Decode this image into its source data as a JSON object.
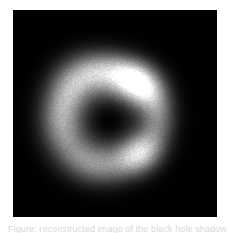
{
  "figure": {
    "panel_background": "#000000",
    "page_background": "#ffffff",
    "colormap": "grayscale",
    "caption_cutoff_text": "Figure: reconstructed image of the black hole shadow"
  },
  "chart_data": {
    "type": "heatmap",
    "title": "",
    "subtitle": "",
    "xlabel": "",
    "ylabel": "",
    "colormap": "grayscale",
    "grid": false,
    "legend": "none",
    "axis_ticks_visible": false,
    "background_color": "#000000",
    "xlim": [
      0,
      204
    ],
    "ylim": [
      0,
      207
    ],
    "value_range": [
      0.0,
      1.0
    ],
    "features": [
      {
        "name": "central-shadow",
        "kind": "dark-depression",
        "cx": 95,
        "cy": 110,
        "rx": 30,
        "ry": 28,
        "intensity": 0.02
      },
      {
        "name": "bright-knot-upper-right",
        "kind": "emission-peak",
        "cx": 120,
        "cy": 75,
        "rx": 26,
        "ry": 22,
        "intensity": 1.0
      },
      {
        "name": "bright-knot-lower-right",
        "kind": "emission-peak",
        "cx": 124,
        "cy": 142,
        "rx": 22,
        "ry": 20,
        "intensity": 0.86
      },
      {
        "name": "left-arc",
        "kind": "emission-arc",
        "cx": 52,
        "cy": 105,
        "rx": 30,
        "ry": 44,
        "intensity": 0.52
      },
      {
        "name": "upper-left-arc",
        "kind": "emission-arc",
        "cx": 72,
        "cy": 62,
        "rx": 34,
        "ry": 26,
        "intensity": 0.45
      },
      {
        "name": "lower-arc",
        "kind": "emission-arc",
        "cx": 84,
        "cy": 152,
        "rx": 32,
        "ry": 24,
        "intensity": 0.4
      },
      {
        "name": "outer-halo",
        "kind": "diffuse-halo",
        "cx": 96,
        "cy": 108,
        "rx": 74,
        "ry": 72,
        "intensity": 0.1
      }
    ],
    "ring": {
      "center_x": 96,
      "center_y": 108,
      "inner_radius": 28,
      "outer_radius": 70,
      "peak_radius": 48,
      "position_angle_deg": -35,
      "asymmetry": "brightest toward the east/north-east limb"
    }
  }
}
